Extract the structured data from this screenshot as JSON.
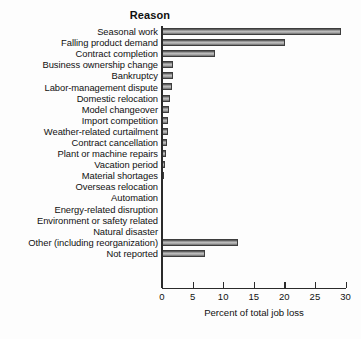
{
  "chart_data": {
    "type": "bar",
    "orientation": "horizontal",
    "title": "Reason",
    "xlabel": "Percent of total job loss",
    "ylabel": "",
    "xlim": [
      0,
      30
    ],
    "xticks": [
      0,
      5,
      10,
      15,
      20,
      25,
      30
    ],
    "grid": false,
    "legend": null,
    "bar_color": "#9a9a9a",
    "bar_edge_color": "#3d3d3d",
    "categories": [
      "Seasonal work",
      "Falling product demand",
      "Contract completion",
      "Business ownership change",
      "Bankruptcy",
      "Labor-management dispute",
      "Domestic relocation",
      "Model changeover",
      "Import competition",
      "Weather-related curtailment",
      "Contract cancellation",
      "Plant or machine repairs",
      "Vacation period",
      "Material shortages",
      "Overseas relocation",
      "Automation",
      "Energy-related disruption",
      "Environment or safety related",
      "Natural disaster",
      "Other (including reorganization)",
      "Not reported"
    ],
    "values": [
      29.5,
      20.2,
      8.9,
      2.0,
      1.9,
      1.8,
      1.5,
      1.3,
      1.2,
      1.1,
      1.0,
      0.8,
      0.6,
      0.5,
      0.35,
      0.3,
      0.25,
      0.2,
      0.15,
      12.6,
      7.2
    ]
  }
}
